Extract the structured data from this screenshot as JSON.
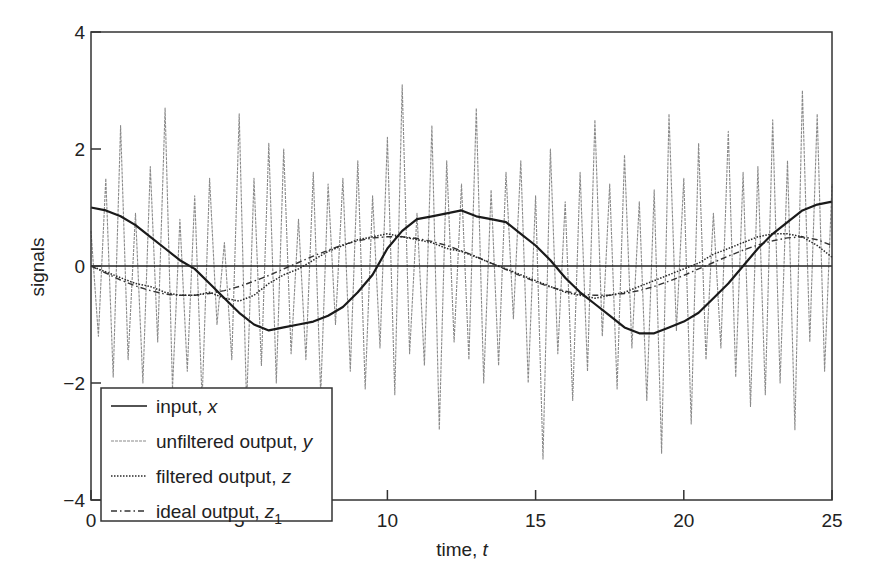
{
  "chart_data": {
    "type": "line",
    "title": "",
    "xlabel": "time, t",
    "xlabel_parts": {
      "text": "time, ",
      "var": "t"
    },
    "ylabel": "signals",
    "xlim": [
      0,
      25
    ],
    "ylim": [
      -4,
      4
    ],
    "xticks": [
      0,
      5,
      10,
      15,
      20,
      25
    ],
    "xtick_labels": [
      "0",
      "5",
      "10",
      "15",
      "20",
      "25"
    ],
    "yticks": [
      -4,
      -2,
      0,
      2,
      4
    ],
    "ytick_labels": [
      "−4",
      "−2",
      "0",
      "2",
      "4"
    ],
    "grid": false,
    "zero_line": true,
    "legend_position": "lower left",
    "legend": [
      {
        "text": "input, ",
        "var": "x",
        "sub": "",
        "style": "solid"
      },
      {
        "text": "unfiltered output, ",
        "var": "y",
        "sub": "",
        "style": "dashed-gray"
      },
      {
        "text": "filtered output, ",
        "var": "z",
        "sub": "",
        "style": "dotted"
      },
      {
        "text": "ideal output, ",
        "var": "z",
        "sub": "1",
        "style": "dashdot"
      }
    ],
    "series": [
      {
        "name": "input, x",
        "style": "solid",
        "x": [
          0,
          0.5,
          1,
          1.5,
          2,
          2.5,
          3,
          3.5,
          4,
          4.5,
          5,
          5.5,
          6,
          6.5,
          7,
          7.5,
          8,
          8.5,
          9,
          9.5,
          10,
          10.5,
          11,
          11.5,
          12,
          12.5,
          13,
          13.5,
          14,
          14.5,
          15,
          15.5,
          16,
          16.5,
          17,
          17.5,
          18,
          18.5,
          19,
          19.5,
          20,
          20.5,
          21,
          21.5,
          22,
          22.5,
          23,
          23.5,
          24,
          24.5,
          25
        ],
        "values": [
          1.0,
          0.95,
          0.85,
          0.7,
          0.5,
          0.3,
          0.1,
          -0.05,
          -0.3,
          -0.55,
          -0.8,
          -1.0,
          -1.1,
          -1.05,
          -1.0,
          -0.95,
          -0.85,
          -0.7,
          -0.45,
          -0.15,
          0.3,
          0.6,
          0.8,
          0.85,
          0.9,
          0.95,
          0.85,
          0.8,
          0.75,
          0.55,
          0.35,
          0.1,
          -0.2,
          -0.45,
          -0.65,
          -0.85,
          -1.05,
          -1.15,
          -1.15,
          -1.05,
          -0.95,
          -0.8,
          -0.55,
          -0.3,
          0.0,
          0.3,
          0.55,
          0.75,
          0.95,
          1.05,
          1.1
        ]
      },
      {
        "name": "unfiltered output, y",
        "style": "dashed-gray",
        "x_start": 0,
        "x_step": 0.25,
        "values": [
          0.6,
          -1.2,
          1.5,
          -1.9,
          2.4,
          -1.6,
          0.9,
          -2.0,
          1.7,
          -1.3,
          2.7,
          -2.1,
          0.8,
          -1.8,
          1.2,
          -2.3,
          1.5,
          -1.0,
          0.4,
          -1.6,
          2.6,
          -2.4,
          1.5,
          -1.7,
          2.1,
          -2.0,
          2.0,
          -1.5,
          0.8,
          -1.6,
          1.6,
          -2.2,
          1.4,
          -1.0,
          1.5,
          -1.8,
          1.8,
          -2.1,
          1.2,
          -1.4,
          2.2,
          -2.2,
          3.1,
          -1.5,
          0.9,
          -1.7,
          2.4,
          -2.8,
          1.8,
          -1.3,
          1.4,
          -1.6,
          2.7,
          -2.0,
          1.3,
          -1.7,
          1.6,
          -0.9,
          1.8,
          -2.0,
          1.2,
          -3.3,
          2.0,
          -1.5,
          1.1,
          -2.3,
          1.6,
          -1.8,
          2.5,
          -1.2,
          1.4,
          -2.1,
          1.9,
          -1.4,
          1.1,
          -2.3,
          1.3,
          -3.2,
          2.6,
          -1.1,
          1.5,
          -2.7,
          2.1,
          -1.6,
          0.9,
          -1.4,
          2.3,
          -1.9,
          1.6,
          -2.4,
          1.7,
          -2.2,
          2.5,
          -2.0,
          1.8,
          -2.8,
          3.0,
          -1.3,
          2.6,
          -1.8,
          1.4
        ]
      },
      {
        "name": "filtered output, z",
        "style": "dotted",
        "x": [
          0,
          0.5,
          1,
          1.5,
          2,
          2.5,
          3,
          3.5,
          4,
          4.5,
          5,
          5.5,
          6,
          6.5,
          7,
          7.5,
          8,
          8.5,
          9,
          9.5,
          10,
          10.5,
          11,
          11.5,
          12,
          12.5,
          13,
          13.5,
          14,
          14.5,
          15,
          15.5,
          16,
          16.5,
          17,
          17.5,
          18,
          18.5,
          19,
          19.5,
          20,
          20.5,
          21,
          21.5,
          22,
          22.5,
          23,
          23.5,
          24,
          24.5,
          25
        ],
        "values": [
          0.0,
          -0.1,
          -0.2,
          -0.3,
          -0.35,
          -0.45,
          -0.5,
          -0.5,
          -0.45,
          -0.55,
          -0.6,
          -0.5,
          -0.3,
          -0.15,
          -0.05,
          0.1,
          0.25,
          0.35,
          0.45,
          0.5,
          0.55,
          0.5,
          0.45,
          0.4,
          0.3,
          0.25,
          0.15,
          0.05,
          -0.05,
          -0.15,
          -0.25,
          -0.35,
          -0.45,
          -0.5,
          -0.55,
          -0.5,
          -0.45,
          -0.35,
          -0.25,
          -0.15,
          -0.05,
          0.05,
          0.2,
          0.3,
          0.4,
          0.5,
          0.55,
          0.55,
          0.5,
          0.35,
          0.15
        ]
      },
      {
        "name": "ideal output, z1",
        "style": "dashdot",
        "x": [
          0,
          0.5,
          1,
          1.5,
          2,
          2.5,
          3,
          3.5,
          4,
          4.5,
          5,
          5.5,
          6,
          6.5,
          7,
          7.5,
          8,
          8.5,
          9,
          9.5,
          10,
          10.5,
          11,
          11.5,
          12,
          12.5,
          13,
          13.5,
          14,
          14.5,
          15,
          15.5,
          16,
          16.5,
          17,
          17.5,
          18,
          18.5,
          19,
          19.5,
          20,
          20.5,
          21,
          21.5,
          22,
          22.5,
          23,
          23.5,
          24,
          24.5,
          25
        ],
        "values": [
          0.0,
          -0.12,
          -0.24,
          -0.34,
          -0.42,
          -0.48,
          -0.5,
          -0.5,
          -0.47,
          -0.42,
          -0.35,
          -0.26,
          -0.16,
          -0.05,
          0.06,
          0.17,
          0.27,
          0.36,
          0.43,
          0.48,
          0.5,
          0.5,
          0.47,
          0.42,
          0.35,
          0.26,
          0.16,
          0.05,
          -0.06,
          -0.17,
          -0.27,
          -0.36,
          -0.43,
          -0.48,
          -0.5,
          -0.5,
          -0.47,
          -0.42,
          -0.35,
          -0.26,
          -0.16,
          -0.05,
          0.06,
          0.17,
          0.27,
          0.36,
          0.43,
          0.48,
          0.5,
          0.45,
          0.35
        ]
      }
    ]
  },
  "colors": {
    "axis": "#222222",
    "input": "#1a1a1a",
    "unfiltered": "#8a8a8a",
    "filtered": "#2a2a2a",
    "ideal": "#333333",
    "background": "#ffffff"
  }
}
